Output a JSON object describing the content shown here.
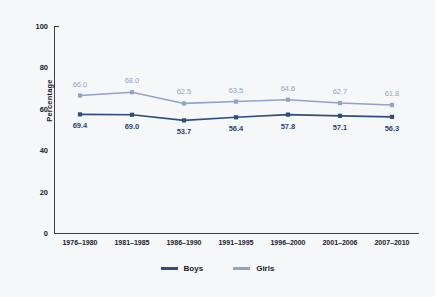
{
  "chart_data": {
    "type": "line",
    "title": "",
    "xlabel": "",
    "ylabel": "Percentage",
    "ylim": [
      0,
      100
    ],
    "yticks": [
      0,
      20,
      40,
      60,
      80,
      100
    ],
    "grid": false,
    "legend_position": "bottom-center",
    "categories": [
      "1976–1980",
      "1981–1985",
      "1986–1990",
      "1991–1995",
      "1996–2000",
      "2001–2006",
      "2007–2010"
    ],
    "series": [
      {
        "name": "Boys",
        "color": "#2d4f7c",
        "label_position": "below",
        "values": [
          69.4,
          69.0,
          53.7,
          56.4,
          57.8,
          57.1,
          56.3
        ],
        "plotted": [
          57.3,
          57.1,
          54.4,
          55.9,
          57.2,
          56.6,
          56.1
        ]
      },
      {
        "name": "Girls",
        "color": "#8ea4cd",
        "label_position": "above",
        "values": [
          66.0,
          68.0,
          62.5,
          63.5,
          64.6,
          62.7,
          61.8
        ],
        "plotted": [
          66.4,
          68.0,
          62.6,
          63.5,
          64.4,
          62.8,
          61.8
        ]
      }
    ]
  },
  "legend": {
    "items": [
      {
        "label": "Boys",
        "color": "#2d4f7c"
      },
      {
        "label": "Girls",
        "color": "#8ea4cd"
      }
    ]
  }
}
